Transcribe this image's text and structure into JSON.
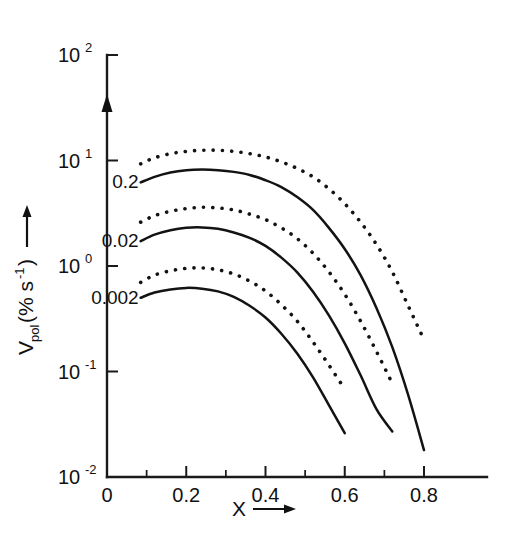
{
  "chart_data": {
    "type": "line",
    "title": "",
    "xlabel": "X",
    "ylabel": "Vpol(% s-1)",
    "ylabel_main": "V",
    "ylabel_sub": "pol",
    "ylabel_unit": "(% s",
    "ylabel_unit_exp": "-1",
    "ylabel_unit_close": ")",
    "xlim": [
      0,
      0.86
    ],
    "ylim": [
      0.01,
      100
    ],
    "yscale": "log",
    "xscale": "linear",
    "grid": false,
    "legend": null,
    "x_ticks": [
      "0",
      "0.2",
      "0.4",
      "0.6",
      "0.8"
    ],
    "x_tick_values": [
      0,
      0.2,
      0.4,
      0.6,
      0.8
    ],
    "x_minor_tick_values": [
      0.1,
      0.3,
      0.5,
      0.7
    ],
    "y_ticks": [
      {
        "mantissa": "10",
        "exponent": "2",
        "value": 100
      },
      {
        "mantissa": "10",
        "exponent": "1",
        "value": 10
      },
      {
        "mantissa": "10",
        "exponent": "0",
        "value": 1
      },
      {
        "mantissa": "10",
        "exponent": "-1",
        "value": 0.1
      },
      {
        "mantissa": "10",
        "exponent": "-2",
        "value": 0.01
      }
    ],
    "curve_labels": [
      "0.2",
      "0.02",
      "0.002"
    ],
    "series": [
      {
        "name": "0.2 dotted",
        "style": "dotted",
        "label": "0.2",
        "x": [
          0.085,
          0.12,
          0.16,
          0.2,
          0.24,
          0.28,
          0.32,
          0.36,
          0.4,
          0.44,
          0.48,
          0.52,
          0.56,
          0.6,
          0.64,
          0.68,
          0.72,
          0.76,
          0.8
        ],
        "y": [
          9.3,
          10.6,
          11.6,
          12.2,
          12.5,
          12.5,
          12.2,
          11.6,
          10.8,
          9.7,
          8.4,
          7.0,
          5.4,
          3.9,
          2.6,
          1.6,
          0.88,
          0.42,
          0.2
        ]
      },
      {
        "name": "0.2 solid",
        "style": "solid",
        "label": "0.2",
        "x": [
          0.085,
          0.12,
          0.16,
          0.2,
          0.24,
          0.28,
          0.32,
          0.36,
          0.4,
          0.44,
          0.48,
          0.52,
          0.56,
          0.6,
          0.64,
          0.68,
          0.72,
          0.76,
          0.8
        ],
        "y": [
          6.2,
          7.0,
          7.7,
          8.1,
          8.2,
          8.1,
          7.8,
          7.3,
          6.5,
          5.6,
          4.5,
          3.4,
          2.3,
          1.45,
          0.82,
          0.4,
          0.17,
          0.06,
          0.018
        ]
      },
      {
        "name": "0.02 dotted",
        "style": "dotted",
        "label": "0.02",
        "x": [
          0.085,
          0.12,
          0.16,
          0.2,
          0.24,
          0.28,
          0.32,
          0.36,
          0.4,
          0.44,
          0.48,
          0.52,
          0.56,
          0.6,
          0.64,
          0.68,
          0.72
        ],
        "y": [
          2.6,
          3.0,
          3.3,
          3.5,
          3.6,
          3.55,
          3.4,
          3.1,
          2.75,
          2.3,
          1.82,
          1.32,
          0.88,
          0.54,
          0.3,
          0.155,
          0.077
        ]
      },
      {
        "name": "0.02 solid",
        "style": "solid",
        "label": "0.02",
        "x": [
          0.085,
          0.12,
          0.16,
          0.2,
          0.24,
          0.28,
          0.32,
          0.36,
          0.4,
          0.44,
          0.48,
          0.52,
          0.56,
          0.6,
          0.64,
          0.68,
          0.72
        ],
        "y": [
          1.72,
          1.98,
          2.18,
          2.3,
          2.32,
          2.25,
          2.08,
          1.85,
          1.55,
          1.2,
          0.87,
          0.57,
          0.34,
          0.185,
          0.092,
          0.044,
          0.027
        ]
      },
      {
        "name": "0.002 dotted",
        "style": "dotted",
        "label": "0.002",
        "x": [
          0.085,
          0.12,
          0.16,
          0.2,
          0.24,
          0.28,
          0.32,
          0.36,
          0.4,
          0.44,
          0.48,
          0.52,
          0.56,
          0.6
        ],
        "y": [
          0.7,
          0.82,
          0.9,
          0.95,
          0.96,
          0.92,
          0.84,
          0.72,
          0.58,
          0.43,
          0.3,
          0.19,
          0.115,
          0.068
        ]
      },
      {
        "name": "0.002 solid",
        "style": "solid",
        "label": "0.002",
        "x": [
          0.085,
          0.12,
          0.16,
          0.2,
          0.24,
          0.28,
          0.32,
          0.36,
          0.4,
          0.44,
          0.48,
          0.52,
          0.56,
          0.6
        ],
        "y": [
          0.5,
          0.56,
          0.6,
          0.62,
          0.61,
          0.575,
          0.51,
          0.42,
          0.325,
          0.228,
          0.148,
          0.088,
          0.048,
          0.026
        ]
      }
    ]
  }
}
